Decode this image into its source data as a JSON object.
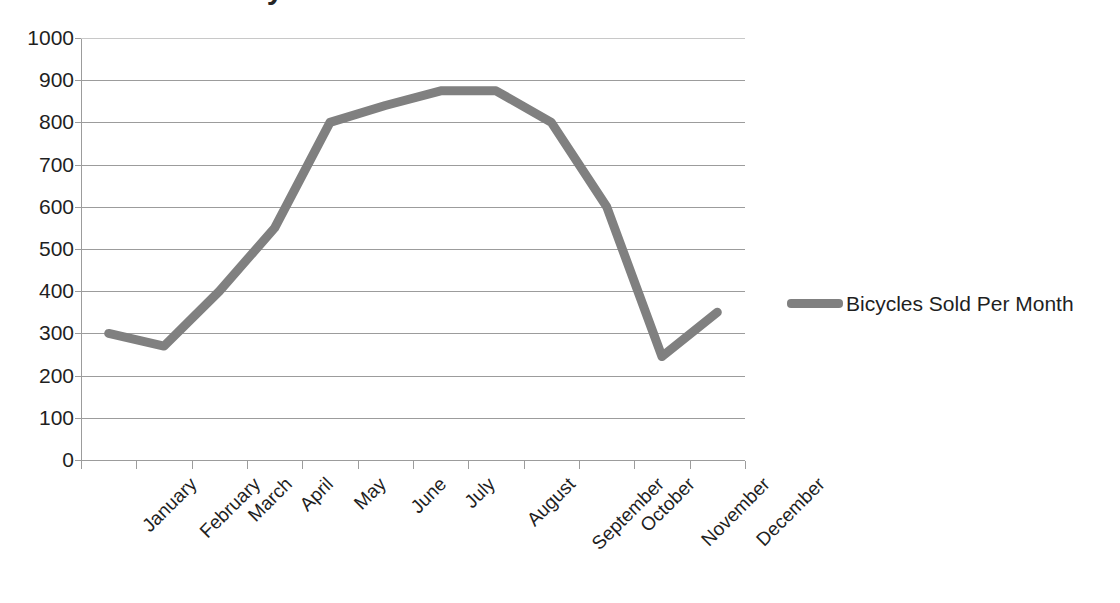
{
  "chart_data": {
    "type": "line",
    "title": "Bicycles Sold Per Month",
    "xlabel": "",
    "ylabel": "",
    "categories": [
      "January",
      "February",
      "March",
      "April",
      "May",
      "June",
      "July",
      "August",
      "September",
      "October",
      "November",
      "December"
    ],
    "series": [
      {
        "name": "Bicycles Sold Per Month",
        "color": "#808080",
        "values": [
          300,
          270,
          400,
          550,
          800,
          840,
          875,
          875,
          800,
          600,
          245,
          350
        ]
      }
    ],
    "ylim": [
      0,
      1000
    ],
    "ytick_step": 100,
    "yticks": [
      "1000",
      "900",
      "800",
      "700",
      "600",
      "500",
      "400",
      "300",
      "200",
      "100",
      "0"
    ],
    "grid": true,
    "grid_axis": "y",
    "legend_position": "right",
    "marker": "none"
  },
  "legend": {
    "entries": [
      {
        "label": "Bicycles Sold Per Month",
        "color": "#808080"
      }
    ]
  },
  "colors": {
    "series": "#808080",
    "gridline": "#9c9c9c",
    "axis": "#9c9c9c",
    "text": "#1f1f1f",
    "background": "#ffffff"
  }
}
